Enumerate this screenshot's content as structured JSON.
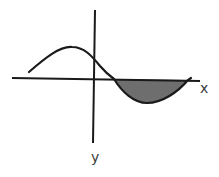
{
  "diagram": {
    "type": "function-graph",
    "axes": {
      "x_label": "x",
      "y_label": "y"
    },
    "curve": {
      "description": "sinusoidal-like curve: rises to a maximum left of the y-axis, crosses the y-axis above origin, crosses the x-axis to the right, dips to a minimum and returns to the x-axis"
    },
    "shaded_region": {
      "description": "area between the curve and the x-axis where the curve is below the x-axis (right of y-axis)",
      "fill": "#6e6e6e"
    },
    "colors": {
      "stroke": "#1a1a1a",
      "shade": "#6e6e6e",
      "background": "#ffffff"
    }
  }
}
